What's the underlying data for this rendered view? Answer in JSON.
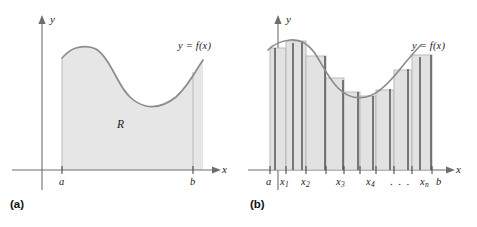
{
  "figure": {
    "width": 477,
    "height": 227,
    "background": "#ffffff"
  },
  "colors": {
    "curve": "#8c8c8c",
    "fill": "#e6e6e6",
    "rect_fill": "#e2e2e2",
    "rect_edge": "#4a4a4a",
    "rect_top": "#b5b5b5",
    "axis": "#6e6e6e",
    "text": "#1b1b1b",
    "caption": "#111111"
  },
  "panel_a": {
    "caption": "(a)",
    "y_axis_label": "y",
    "x_axis_label": "x",
    "curve_label": "y = f(x)",
    "region_label": "R",
    "tick_labels": [
      "a",
      "b"
    ],
    "axes": {
      "x_axis_y": 170,
      "y_axis_x": 42,
      "a_x": 62,
      "b_x": 193
    },
    "curve_points": "62,58 72,52 82,47 95,47 108,56 122,74 136,93 150,104 163,107 175,102 186,90 196,74 203,62"
  },
  "panel_b": {
    "caption": "(b)",
    "y_axis_label": "y",
    "x_axis_label": "x",
    "curve_label": "y = f(x)",
    "tick_labels": [
      "a",
      "x1",
      "x2",
      "x3",
      "x4",
      "...",
      "xn",
      "b"
    ],
    "tick_labels_display": [
      "a",
      "x",
      "x",
      "x",
      "x",
      ". . .",
      "x",
      "b"
    ],
    "tick_subscripts": [
      "",
      "1",
      "2",
      "3",
      "4",
      "",
      "n",
      ""
    ],
    "axes": {
      "x_axis_y": 170,
      "y_axis_x": 38,
      "a_x": 30,
      "b_x": 192
    },
    "curve_points": "28,50 38,44 50,41 62,42 74,49 86,62 98,79 110,91 122,96 134,94 146,87 158,75 170,62 180,50",
    "rectangles": [
      {
        "x": 28,
        "width": 18,
        "top": 48
      },
      {
        "x": 46,
        "width": 20,
        "top": 41
      },
      {
        "x": 66,
        "width": 20,
        "top": 55
      },
      {
        "x": 86,
        "width": 18,
        "top": 77
      },
      {
        "x": 104,
        "width": 16,
        "top": 92
      },
      {
        "x": 120,
        "width": 16,
        "top": 96
      },
      {
        "x": 136,
        "width": 18,
        "top": 90
      },
      {
        "x": 154,
        "width": 18,
        "top": 70
      },
      {
        "x": 172,
        "width": 20,
        "top": 55
      }
    ],
    "tick_positions": [
      30,
      46,
      66,
      86,
      104,
      120,
      136,
      154,
      172,
      192
    ]
  }
}
